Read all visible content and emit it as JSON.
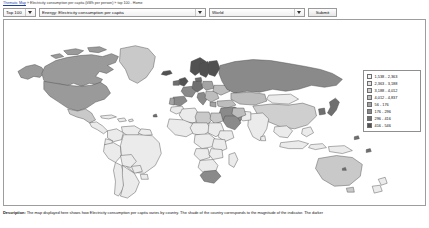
{
  "breadcrumb": {
    "home_label": "Thematic Map",
    "sep": "»",
    "current_label": "Electricity consumption per capita (kWh per person)",
    "tail_label": "top 100 - Home"
  },
  "toolbar": {
    "rank_select": {
      "value": "Top 100",
      "options": [
        "Top 100",
        "Top 50",
        "Top 25",
        "All"
      ]
    },
    "indicator_select": {
      "value": "Energy: Electricity consumption per capita",
      "options": [
        "Energy: Electricity consumption per capita"
      ]
    },
    "region_select": {
      "value": "World",
      "options": [
        "World",
        "Africa",
        "Asia",
        "Europe",
        "North America",
        "South America",
        "Oceania"
      ]
    },
    "submit_label": "Submit"
  },
  "legend": {
    "rows": [
      {
        "label": "1,538 - 2,363",
        "color": "#f2f2f2"
      },
      {
        "label": "2,363 - 3,188",
        "color": "#e2e2e2"
      },
      {
        "label": "3,188 - 4,012",
        "color": "#cfcfcf"
      },
      {
        "label": "4,012 - 4,837",
        "color": "#bdbdbd"
      },
      {
        "label": "56 - 176",
        "color": "#a3a3a3"
      },
      {
        "label": "176 - 296",
        "color": "#8a8a8a"
      },
      {
        "label": "296 - 416",
        "color": "#6f6f6f"
      },
      {
        "label": "416 - 546",
        "color": "#515151"
      }
    ]
  },
  "description": {
    "label": "Description:",
    "text": "The map displayed here shows how Electricity consumption per capita varies by country. The shade of the country corresponds to the magnitude of the indicator. The darker"
  },
  "colors": {
    "map_border": "#4a4a4a",
    "map_fill_light": "#ebebeb",
    "map_fill_mid": "#c9c9c9",
    "map_fill_dark": "#9a9a9a",
    "panel_border": "#9d9d9d",
    "link": "#1a3fa0"
  }
}
